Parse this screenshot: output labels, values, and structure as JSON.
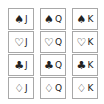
{
  "cards": [
    {
      "suit": "♠",
      "rank": "J",
      "suit_name": "spade"
    },
    {
      "suit": "♠",
      "rank": "Q",
      "suit_name": "spade"
    },
    {
      "suit": "♠",
      "rank": "K",
      "suit_name": "spade"
    },
    {
      "suit": "♡",
      "rank": "J",
      "suit_name": "heart"
    },
    {
      "suit": "♡",
      "rank": "Q",
      "suit_name": "heart"
    },
    {
      "suit": "♡",
      "rank": "K",
      "suit_name": "heart"
    },
    {
      "suit": "♣",
      "rank": "J",
      "suit_name": "club"
    },
    {
      "suit": "♣",
      "rank": "Q",
      "suit_name": "club"
    },
    {
      "suit": "♣",
      "rank": "K",
      "suit_name": "club"
    },
    {
      "suit": "♢",
      "rank": "J",
      "suit_name": "diamond"
    },
    {
      "suit": "♢",
      "rank": "Q",
      "suit_name": "diamond"
    },
    {
      "suit": "♢",
      "rank": "K",
      "suit_name": "diamond"
    }
  ]
}
